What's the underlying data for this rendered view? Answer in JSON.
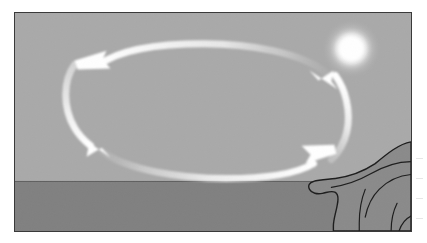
{
  "figure": {
    "alt_description": "Grayscale seascape with a glowing sun, a rocky headland at right, and a white elliptical loop of arrows over the water indicating a circular air circulation"
  },
  "scene": {
    "sky": {
      "name": "sky",
      "color": "#a9a9a9",
      "horizon_y_fraction": 0.77
    },
    "sea": {
      "name": "sea",
      "color": "#808080"
    },
    "sun": {
      "name": "sun",
      "color": "#ffffff",
      "center_x_fraction": 0.85,
      "center_y_fraction": 0.16,
      "radius_fraction": 0.055,
      "glow": "soft radial halo"
    },
    "headland": {
      "name": "rocky-headland",
      "color": "#8a8a8a",
      "outline_color": "#1c1c1c",
      "position": "right edge, straddling the horizon"
    },
    "frame": {
      "border_color": "#3a3a3a",
      "border_width_px": 1.5
    }
  },
  "circulation": {
    "name": "circulation-loop",
    "arc_color": "#f0f0f0",
    "arrow_color": "#ffffff",
    "direction": "clockwise-when-viewed-from-above",
    "arrows": [
      {
        "id": "arrow-upper-left",
        "label": "flow toward the left (offshore aloft)",
        "heading": "left"
      },
      {
        "id": "arrow-lower-left",
        "label": "flow descending at left",
        "heading": "down-right"
      },
      {
        "id": "arrow-lower-right",
        "label": "flow toward the right (onshore at surface)",
        "heading": "up-right"
      },
      {
        "id": "arrow-upper-right",
        "label": "flow rising at right",
        "heading": "up-left"
      }
    ]
  },
  "margin": {
    "marks_count": 4,
    "note": "faint cropped marks at the right page edge"
  }
}
